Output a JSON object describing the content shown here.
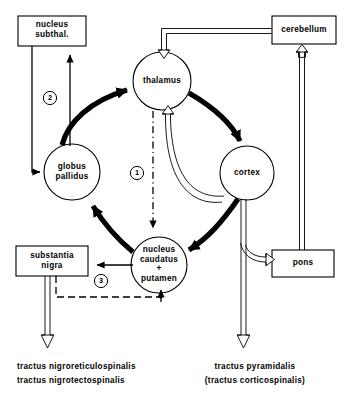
{
  "diagram": {
    "nodes": {
      "nucleus_subthal": "nucleus\nsubthal.",
      "cerebellum": "cerebellum",
      "thalamus": "thalamus",
      "globus_pallidus": "globus\npallidus",
      "cortex": "cortex",
      "nucleus_caudatus_putamen": "nucleus\ncaudatus\n+\nputamen",
      "substantia_nigra": "substantia\nnigra",
      "pons": "pons"
    },
    "markers": {
      "one": "1",
      "two": "2",
      "three": "3"
    },
    "tracts": {
      "left_line1": "tractus nigroreticulospinalis",
      "left_line2": "tractus nigrotectospinalis",
      "right_line1": "tractus pyramidalis",
      "right_line2": "(tractus corticospinalis)"
    },
    "colors": {
      "stroke": "#000000",
      "background": "#ffffff"
    }
  }
}
